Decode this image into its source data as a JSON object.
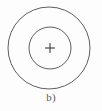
{
  "figure": {
    "caption": "b)",
    "background_color": "#fdfdfd",
    "stroke_color": "#5f5f5f",
    "marker_color": "#3d3d3d",
    "stroke_width": 1,
    "shapes": {
      "outer_circle": {
        "name": "outer-circle",
        "center_x": 49,
        "center_y": 48,
        "radius": 41
      },
      "inner_circle": {
        "name": "inner-circle",
        "center_x": 50,
        "center_y": 48,
        "radius": 21
      },
      "center_marker": {
        "name": "center-plus-marker",
        "center_x": 50,
        "center_y": 48,
        "arm_length": 5,
        "glyph": "plus"
      }
    }
  }
}
